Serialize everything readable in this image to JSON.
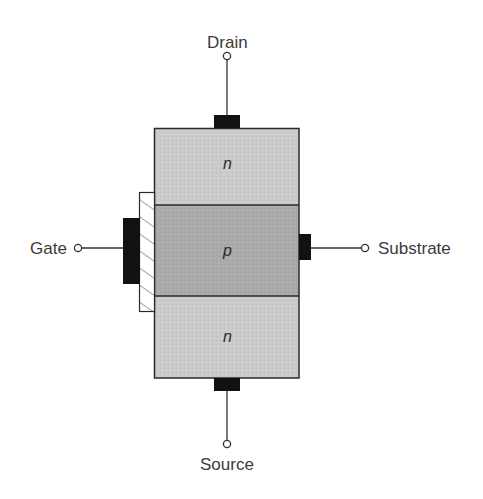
{
  "diagram": {
    "terminals": {
      "drain": "Drain",
      "gate": "Gate",
      "substrate": "Substrate",
      "source": "Source"
    },
    "regions": {
      "top": "n",
      "middle": "p",
      "bottom": "n"
    },
    "colors": {
      "n_region": "#c9c9c9",
      "p_region": "#a9a9a9",
      "contact": "#111111",
      "outline": "#2a2a2a",
      "oxide_hatch": "#555555",
      "text": "#3a3a3a"
    }
  }
}
